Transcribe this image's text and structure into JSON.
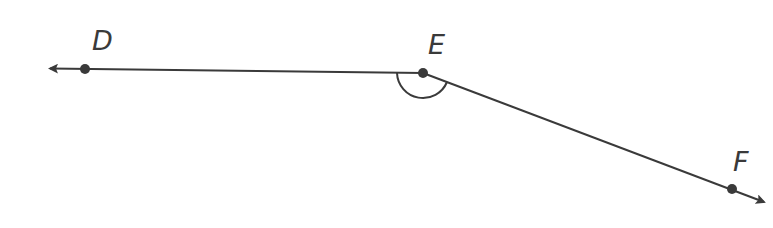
{
  "diagram": {
    "type": "angle",
    "points": [
      {
        "label": "D",
        "x": 85,
        "y": 69
      },
      {
        "label": "E",
        "x": 423,
        "y": 73
      },
      {
        "label": "F",
        "x": 732,
        "y": 189
      }
    ],
    "vertex": "E",
    "angle_mark": "arc",
    "colors": {
      "line": "#3a3a3a",
      "background": "#ffffff"
    }
  }
}
